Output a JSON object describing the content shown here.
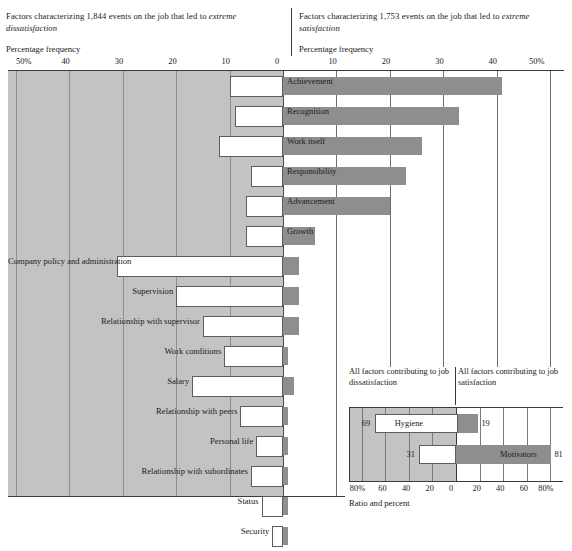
{
  "header": {
    "left_line1": "Factors characterizing 1,844 events on the job that led to",
    "left_line2": "extreme dissatisfaction",
    "left_axis_title": "Percentage frequency",
    "right_line1": "Factors characterizing 1,753 events on the job that led to",
    "right_line2": "extreme satisfaction",
    "right_axis_title": "Percentage frequency"
  },
  "axis": {
    "left_ticks": [
      "50%",
      "40",
      "30",
      "20",
      "10",
      "0"
    ],
    "right_ticks": [
      "0",
      "10",
      "20",
      "30",
      "40",
      "50%"
    ],
    "tick_positions_pct": [
      50,
      40,
      30,
      20,
      10,
      0
    ]
  },
  "colors": {
    "bar_fill": "#8e8e8e",
    "panel_left_bg": "#c3c3c3",
    "panel_right_bg": "#ffffff",
    "label_box_bg": "#ffffff",
    "rule": "#3b3b3b",
    "grid": "#6f6f6f",
    "text": "#1a1a1a"
  },
  "chart_data": {
    "type": "bar",
    "xlabel": "Percentage frequency",
    "ylabel": "",
    "xlim": [
      -50,
      50
    ],
    "grid": true,
    "legend": "none",
    "categories": [
      "Achievement",
      "Recognition",
      "Work itself",
      "Responsibility",
      "Advancement",
      "Growth",
      "Company policy and administration",
      "Supervision",
      "Relationship with supervisor",
      "Work conditions",
      "Salary",
      "Relationship with peers",
      "Personal life",
      "Relationship with subordinates",
      "Status",
      "Security"
    ],
    "series": [
      {
        "name": "Factors leading to extreme satisfaction",
        "side": "right",
        "values": [
          41,
          33,
          26,
          23,
          20,
          6,
          3,
          3,
          3,
          1,
          2,
          1,
          1,
          1,
          1,
          1
        ]
      },
      {
        "name": "Factors leading to extreme dissatisfaction",
        "side": "left",
        "values": [
          10,
          9,
          12,
          6,
          7,
          7,
          31,
          20,
          15,
          11,
          17,
          8,
          5,
          6,
          4,
          2
        ]
      }
    ]
  },
  "rows": [
    {
      "label": "Achievement",
      "right": 41,
      "left": 10,
      "label_side": "right"
    },
    {
      "label": "Recognition",
      "right": 33,
      "left": 9,
      "label_side": "right"
    },
    {
      "label": "Work itself",
      "right": 26,
      "left": 12,
      "label_side": "right"
    },
    {
      "label": "Responsibility",
      "right": 23,
      "left": 6,
      "label_side": "right"
    },
    {
      "label": "Advancement",
      "right": 20,
      "left": 7,
      "label_side": "right"
    },
    {
      "label": "Growth",
      "right": 6,
      "left": 7,
      "label_side": "right"
    },
    {
      "label": "Company policy and administration",
      "right": 3,
      "left": 31,
      "label_side": "left"
    },
    {
      "label": "Supervision",
      "right": 3,
      "left": 20,
      "label_side": "left"
    },
    {
      "label": "Relationship with supervisor",
      "right": 3,
      "left": 15,
      "label_side": "left"
    },
    {
      "label": "Work conditions",
      "right": 1,
      "left": 11,
      "label_side": "left"
    },
    {
      "label": "Salary",
      "right": 2,
      "left": 17,
      "label_side": "left"
    },
    {
      "label": "Relationship with peers",
      "right": 1,
      "left": 8,
      "label_side": "left"
    },
    {
      "label": "Personal life",
      "right": 1,
      "left": 5,
      "label_side": "left"
    },
    {
      "label": "Relationship with subordinates",
      "right": 1,
      "left": 6,
      "label_side": "left"
    },
    {
      "label": "Status",
      "right": 1,
      "left": 4,
      "label_side": "left"
    },
    {
      "label": "Security",
      "right": 1,
      "left": 2,
      "label_side": "left"
    }
  ],
  "inset": {
    "caption_left": "All factors contributing to job dissatisfaction",
    "caption_right": "All factors contributing to job satisfaction",
    "ticks": [
      "80%",
      "60",
      "40",
      "20",
      "0",
      "20",
      "40",
      "60",
      "80%"
    ],
    "axis_caption": "Ratio and percent",
    "bars": [
      {
        "name": "Hygiene",
        "left": 69,
        "right": 19,
        "left_value_label": "69",
        "right_value_label": "19"
      },
      {
        "name": "Motivators",
        "left": 31,
        "right": 81,
        "left_value_label": "31",
        "right_value_label": "81"
      }
    ]
  }
}
